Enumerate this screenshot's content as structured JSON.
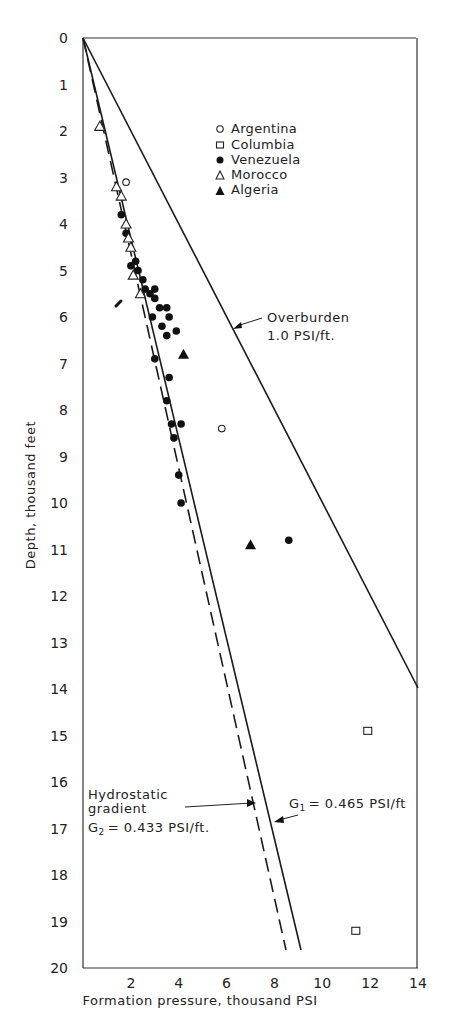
{
  "chart_data": {
    "type": "scatter",
    "title": "",
    "xlabel": "Formation pressure, thousand PSI",
    "ylabel": "Depth, thousand feet",
    "xlim": [
      0,
      14
    ],
    "ylim": [
      0,
      20
    ],
    "y_inverted": true,
    "grid": false,
    "legend_position": "upper-center",
    "x_ticks": [
      "2",
      "4",
      "6",
      "8",
      "10",
      "12",
      "14"
    ],
    "y_ticks": [
      "0",
      "1",
      "2",
      "3",
      "4",
      "5",
      "6",
      "7",
      "8",
      "9",
      "10",
      "11",
      "12",
      "13",
      "14",
      "15",
      "16",
      "17",
      "18",
      "19",
      "20"
    ],
    "series": [
      {
        "name": "Argentina",
        "marker": "open-circle",
        "points": [
          [
            1.8,
            3.1
          ],
          [
            5.8,
            8.4
          ]
        ]
      },
      {
        "name": "Columbia",
        "marker": "open-square",
        "points": [
          [
            11.9,
            14.9
          ],
          [
            11.4,
            19.2
          ]
        ]
      },
      {
        "name": "Venezuela",
        "marker": "filled-circle",
        "points": [
          [
            1.6,
            3.8
          ],
          [
            1.8,
            4.2
          ],
          [
            2.0,
            4.9
          ],
          [
            2.2,
            4.8
          ],
          [
            2.3,
            5.0
          ],
          [
            2.5,
            5.2
          ],
          [
            2.6,
            5.4
          ],
          [
            2.8,
            5.5
          ],
          [
            3.0,
            5.4
          ],
          [
            3.0,
            5.6
          ],
          [
            3.2,
            5.8
          ],
          [
            3.5,
            5.8
          ],
          [
            3.6,
            6.0
          ],
          [
            3.3,
            6.2
          ],
          [
            2.9,
            6.0
          ],
          [
            3.5,
            6.4
          ],
          [
            3.9,
            6.3
          ],
          [
            3.0,
            6.9
          ],
          [
            3.6,
            7.3
          ],
          [
            3.5,
            7.8
          ],
          [
            3.7,
            8.3
          ],
          [
            4.1,
            8.3
          ],
          [
            3.8,
            8.6
          ],
          [
            4.0,
            9.4
          ],
          [
            4.1,
            10.0
          ],
          [
            8.6,
            10.8
          ]
        ]
      },
      {
        "name": "Morocco",
        "marker": "open-triangle",
        "points": [
          [
            0.7,
            1.9
          ],
          [
            1.4,
            3.2
          ],
          [
            1.6,
            3.4
          ],
          [
            1.8,
            4.0
          ],
          [
            1.9,
            4.3
          ],
          [
            2.0,
            4.5
          ],
          [
            2.1,
            5.1
          ],
          [
            2.4,
            5.5
          ]
        ]
      },
      {
        "name": "Algeria",
        "marker": "filled-triangle",
        "points": [
          [
            4.2,
            6.8
          ],
          [
            7.0,
            10.9
          ]
        ]
      }
    ],
    "lines": [
      {
        "name": "Overburden",
        "label": "Overburden",
        "label2": "1.0 PSI/ft.",
        "style": "solid",
        "gradient": 1.0,
        "from": [
          0,
          0
        ],
        "to": [
          14,
          14
        ]
      },
      {
        "name": "G1",
        "label": "G1 = 0.465 PSI/ft",
        "style": "solid",
        "gradient": 0.465,
        "from": [
          0,
          0
        ],
        "to": [
          9.0,
          19.4
        ]
      },
      {
        "name": "G2 Hydrostatic gradient",
        "label": "Hydrostatic gradient",
        "label2": "G2 = 0.433 PSI/ft.",
        "style": "dashed",
        "gradient": 0.433,
        "from": [
          0,
          0
        ],
        "to": [
          8.4,
          19.4
        ]
      }
    ],
    "annotations": [
      "Overburden 1.0 PSI/ft.",
      "Hydrostatic gradient G2 = 0.433 PSI/ft.",
      "G1 = 0.465 PSI/ft"
    ]
  },
  "labels": {
    "xlabel": "Formation pressure, thousand PSI",
    "ylabel": "Depth, thousand feet",
    "overburden_1": "Overburden",
    "overburden_2": "1.0 PSI/ft.",
    "hydro_1": "Hydrostatic",
    "hydro_2": "gradient",
    "g2_label": "= 0.433 PSI/ft.",
    "g1_label": "= 0.465 PSI/ft",
    "g_letter": "G",
    "sub1": "1",
    "sub2": "2"
  },
  "legend": {
    "items": [
      "Argentina",
      "Columbia",
      "Venezuela",
      "Morocco",
      "Algeria"
    ]
  }
}
